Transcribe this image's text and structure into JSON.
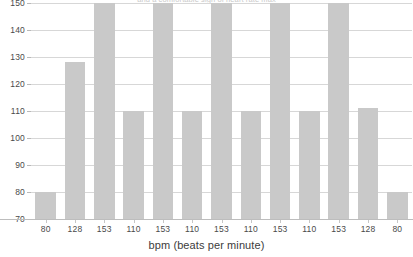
{
  "chart_data": {
    "type": "bar",
    "title": "and a comfortable sign of heart rate max",
    "xlabel": "bpm (beats per minute)",
    "ylabel": "",
    "categories": [
      "80",
      "128",
      "153",
      "110",
      "153",
      "110",
      "153",
      "110",
      "153",
      "110",
      "153",
      "128",
      "80"
    ],
    "values": [
      80,
      128,
      153,
      110,
      153,
      110,
      153,
      110,
      153,
      110,
      153,
      111,
      80
    ],
    "ylim": [
      70,
      150
    ],
    "yticks": [
      70,
      80,
      90,
      100,
      110,
      120,
      130,
      140,
      150
    ],
    "ytick_labels": [
      "70",
      "80",
      "90",
      "100",
      "110",
      "120",
      "130",
      "140",
      "150"
    ],
    "grid": true,
    "legend": "none",
    "bar_color": "#c9c9c9",
    "grid_color": "#d7d7d7",
    "axis_color": "#bdbdbd",
    "note": "bars with value 153 are clipped by the top of the plot area at 150"
  }
}
